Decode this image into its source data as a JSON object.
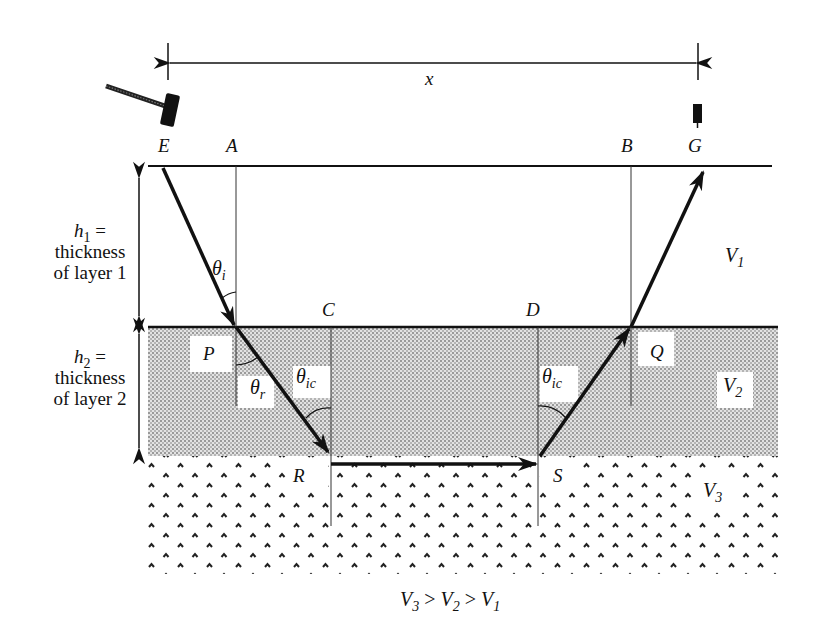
{
  "diagram": {
    "distance_label": "x",
    "points": {
      "E": "E",
      "A": "A",
      "B": "B",
      "G": "G",
      "C": "C",
      "D": "D",
      "P": "P",
      "Q": "Q",
      "R": "R",
      "S": "S"
    },
    "layer1": {
      "h_symbol": "h",
      "h_sub": "1",
      "eq": " =",
      "line2": "thickness",
      "line3": "of layer 1",
      "velocity_symbol": "V",
      "velocity_sub": "1"
    },
    "layer2": {
      "h_symbol": "h",
      "h_sub": "2",
      "eq": " =",
      "line2": "thickness",
      "line3": "of layer 2",
      "velocity_symbol": "V",
      "velocity_sub": "2"
    },
    "layer3": {
      "velocity_symbol": "V",
      "velocity_sub": "3"
    },
    "angles": {
      "incident": {
        "symbol": "θ",
        "sub": "i"
      },
      "refracted": {
        "symbol": "θ",
        "sub": "r"
      },
      "critical_left": {
        "symbol": "θ",
        "sub": "ic"
      },
      "critical_right": {
        "symbol": "θ",
        "sub": "ic"
      }
    },
    "caption": {
      "v3": "V",
      "s3": "3",
      "gt1": " > ",
      "v2": "V",
      "s2": "2",
      "gt2": " > ",
      "v1": "V",
      "s1": "1"
    },
    "icons": {
      "source": "hammer-icon",
      "receiver": "geophone-icon"
    },
    "colors": {
      "ink": "#111111",
      "layer2_fill": "#cfcfcf",
      "layer3_dots": "#222222",
      "background": "#ffffff"
    }
  }
}
